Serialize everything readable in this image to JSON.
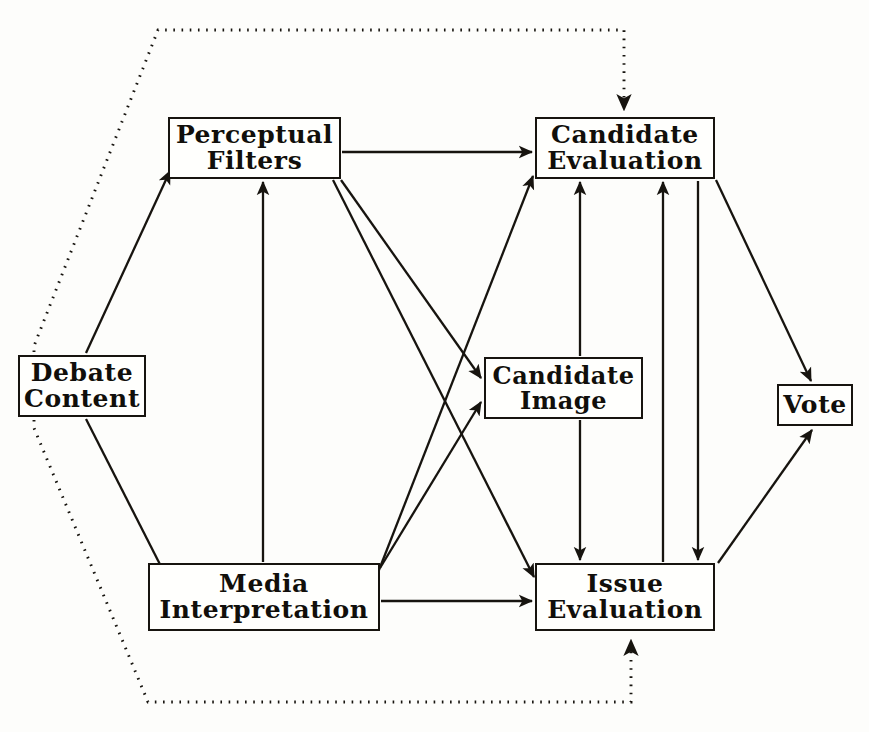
{
  "figure": {
    "top_caption": "",
    "background_color": "#fdfdfb",
    "stroke_color": "#17140f",
    "text_color": "#110f0b"
  },
  "nodes": {
    "debate_content": {
      "line1": "Debate",
      "line2": "Content",
      "x": 18,
      "y": 355,
      "w": 128,
      "h": 62,
      "font_size": 25
    },
    "perceptual_filters": {
      "line1": "Perceptual",
      "line2": "Filters",
      "x": 168,
      "y": 117,
      "w": 173,
      "h": 62,
      "font_size": 25
    },
    "media_interpretation": {
      "line1": "Media",
      "line2": "Interpretation",
      "x": 148,
      "y": 563,
      "w": 232,
      "h": 68,
      "font_size": 25
    },
    "candidate_evaluation": {
      "line1": "Candidate",
      "line2": "Evaluation",
      "x": 535,
      "y": 117,
      "w": 180,
      "h": 62,
      "font_size": 25
    },
    "candidate_image": {
      "line1": "Candidate",
      "line2": "Image",
      "x": 484,
      "y": 357,
      "w": 159,
      "h": 62,
      "font_size": 24
    },
    "issue_evaluation": {
      "line1": "Issue",
      "line2": "Evaluation",
      "x": 535,
      "y": 563,
      "w": 180,
      "h": 68,
      "font_size": 25
    },
    "vote": {
      "line1": "Vote",
      "line2": "",
      "x": 777,
      "y": 384,
      "w": 76,
      "h": 42,
      "font_size": 25
    }
  },
  "edges": [
    {
      "id": "debate-to-perceptual",
      "from": "debate_content",
      "to": "perceptual_filters",
      "style": "solid",
      "arrow": "end"
    },
    {
      "id": "debate-to-media",
      "from": "debate_content",
      "to": "media_interpretation",
      "style": "solid",
      "arrow": "end"
    },
    {
      "id": "perceptual-to-candidate-evaluation",
      "from": "perceptual_filters",
      "to": "candidate_evaluation",
      "style": "solid",
      "arrow": "end"
    },
    {
      "id": "perceptual-to-candidate-image",
      "from": "perceptual_filters",
      "to": "candidate_image",
      "style": "solid",
      "arrow": "end"
    },
    {
      "id": "perceptual-to-issue-evaluation",
      "from": "perceptual_filters",
      "to": "issue_evaluation",
      "style": "solid",
      "arrow": "end"
    },
    {
      "id": "media-to-perceptual",
      "from": "media_interpretation",
      "to": "perceptual_filters",
      "style": "solid",
      "arrow": "end"
    },
    {
      "id": "media-to-candidate-evaluation",
      "from": "media_interpretation",
      "to": "candidate_evaluation",
      "style": "solid",
      "arrow": "end"
    },
    {
      "id": "media-to-candidate-image",
      "from": "media_interpretation",
      "to": "candidate_image",
      "style": "solid",
      "arrow": "end"
    },
    {
      "id": "media-to-issue-evaluation",
      "from": "media_interpretation",
      "to": "issue_evaluation",
      "style": "solid",
      "arrow": "end"
    },
    {
      "id": "candidate-image-to-candidate-evaluation",
      "from": "candidate_image",
      "to": "candidate_evaluation",
      "style": "solid",
      "arrow": "end"
    },
    {
      "id": "candidate-image-to-issue-evaluation",
      "from": "candidate_image",
      "to": "issue_evaluation",
      "style": "solid",
      "arrow": "end"
    },
    {
      "id": "issue-evaluation-to-candidate-evaluation",
      "from": "issue_evaluation",
      "to": "candidate_evaluation",
      "style": "solid",
      "arrow": "end"
    },
    {
      "id": "candidate-evaluation-to-issue-evaluation",
      "from": "candidate_evaluation",
      "to": "issue_evaluation",
      "style": "solid",
      "arrow": "end"
    },
    {
      "id": "candidate-evaluation-to-vote",
      "from": "candidate_evaluation",
      "to": "vote",
      "style": "solid",
      "arrow": "end"
    },
    {
      "id": "issue-evaluation-to-vote",
      "from": "issue_evaluation",
      "to": "vote",
      "style": "solid",
      "arrow": "end"
    },
    {
      "id": "debate-feedback-to-candidate-evaluation",
      "from": "debate_content",
      "to": "candidate_evaluation",
      "style": "dotted",
      "arrow": "end"
    },
    {
      "id": "debate-feedback-to-issue-evaluation",
      "from": "debate_content",
      "to": "issue_evaluation",
      "style": "dotted",
      "arrow": "end"
    }
  ]
}
